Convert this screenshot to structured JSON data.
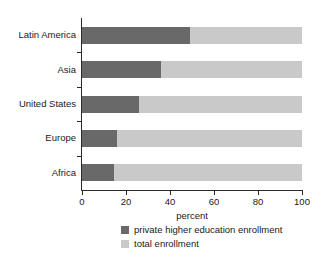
{
  "chart_data": {
    "type": "bar",
    "orientation": "horizontal",
    "title": "",
    "xlabel": "percent",
    "ylabel": "",
    "xlim": [
      0,
      100
    ],
    "xticks": [
      0,
      20,
      40,
      60,
      80,
      100
    ],
    "grid": false,
    "legend_position": "bottom-center",
    "categories": [
      "Latin America",
      "Asia",
      "United States",
      "Europe",
      "Africa"
    ],
    "series": [
      {
        "name": "private higher education enrollment",
        "color": "#696969",
        "values": [
          49,
          36,
          26,
          16,
          14.5
        ]
      },
      {
        "name": "total enrollment",
        "color": "#c9c9c9",
        "values": [
          100,
          100,
          100,
          100,
          100
        ]
      }
    ]
  },
  "axis": {
    "x_title": "percent",
    "x_tick_labels": [
      "0",
      "20",
      "40",
      "60",
      "80",
      "100"
    ]
  },
  "legend": {
    "items": [
      {
        "label": "private higher education enrollment",
        "color": "#696969"
      },
      {
        "label": "total enrollment",
        "color": "#c9c9c9"
      }
    ]
  },
  "colors": {
    "private": "#696969",
    "total": "#c9c9c9",
    "axis": "#2b2b2b",
    "text": "#1a1a1a",
    "background": "#ffffff"
  }
}
